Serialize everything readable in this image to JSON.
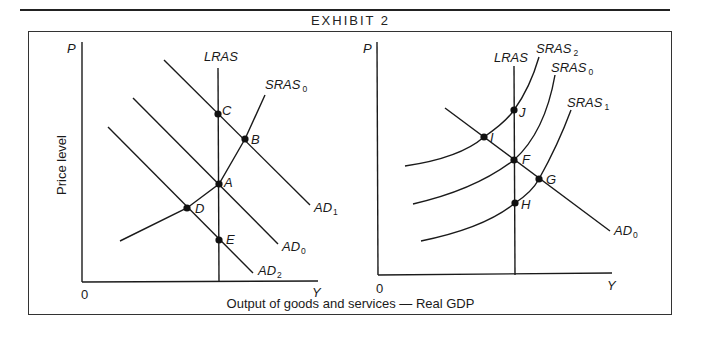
{
  "exhibit": {
    "title": "EXHIBIT 2",
    "x_axis_caption": "Output of goods and services — Real GDP",
    "y_axis_caption": "Price level"
  },
  "left_panel": {
    "axis": {
      "y_label": "P",
      "x_label": "Y",
      "origin_label": "0"
    },
    "curves": {
      "lras": {
        "name": "LRAS"
      },
      "sras0": {
        "name": "SRAS",
        "sub": "0"
      },
      "ad1": {
        "name": "AD",
        "sub": "1"
      },
      "ad0": {
        "name": "AD",
        "sub": "0"
      },
      "ad2": {
        "name": "AD",
        "sub": "2"
      }
    },
    "points": {
      "A": "A",
      "B": "B",
      "C": "C",
      "D": "D",
      "E": "E"
    }
  },
  "right_panel": {
    "axis": {
      "y_label": "P",
      "x_label": "Y",
      "origin_label": "0"
    },
    "curves": {
      "lras": {
        "name": "LRAS"
      },
      "sras2": {
        "name": "SRAS",
        "sub": "2"
      },
      "sras0": {
        "name": "SRAS",
        "sub": "0"
      },
      "sras1": {
        "name": "SRAS",
        "sub": "1"
      },
      "ad0": {
        "name": "AD",
        "sub": "0"
      }
    },
    "points": {
      "F": "F",
      "G": "G",
      "H": "H",
      "I": "I",
      "J": "J"
    }
  },
  "colors": {
    "ink": "#1a1a1a",
    "background": "#ffffff"
  }
}
